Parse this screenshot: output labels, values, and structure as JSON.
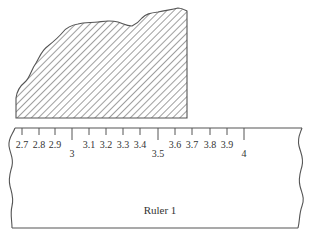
{
  "figure": {
    "colors": {
      "stroke": "#555555",
      "hatch": "#6a6a6a",
      "text": "#333333",
      "background": "#ffffff"
    },
    "hatched_object": {
      "fill_pattern": "diagonal-hatch"
    },
    "ruler": {
      "label": "Ruler 1",
      "ticks": [
        {
          "value": 2.7,
          "label": "2.7",
          "x": 22,
          "major": false
        },
        {
          "value": 2.8,
          "label": "2.8",
          "x": 39,
          "major": false
        },
        {
          "value": 2.9,
          "label": "2.9",
          "x": 55,
          "major": false
        },
        {
          "value": 3.0,
          "label": "3",
          "x": 72,
          "major": true
        },
        {
          "value": 3.1,
          "label": "3.1",
          "x": 89,
          "major": false
        },
        {
          "value": 3.2,
          "label": "3.2",
          "x": 106,
          "major": false
        },
        {
          "value": 3.3,
          "label": "3.3",
          "x": 123,
          "major": false
        },
        {
          "value": 3.4,
          "label": "3.4",
          "x": 140,
          "major": false
        },
        {
          "value": 3.5,
          "label": "3.5",
          "x": 158,
          "major": true
        },
        {
          "value": 3.6,
          "label": "3.6",
          "x": 175,
          "major": false
        },
        {
          "value": 3.7,
          "label": "3.7",
          "x": 192,
          "major": false
        },
        {
          "value": 3.8,
          "label": "3.8",
          "x": 210,
          "major": false
        },
        {
          "value": 3.9,
          "label": "3.9",
          "x": 227,
          "major": false
        },
        {
          "value": 4.0,
          "label": "4",
          "x": 244,
          "major": true
        }
      ]
    }
  }
}
